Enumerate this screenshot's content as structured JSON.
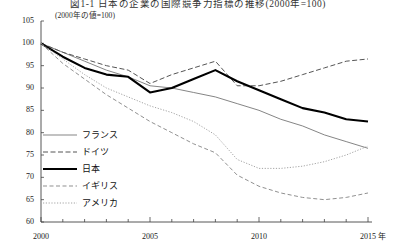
{
  "title": "図1-1  日本の企業の国際競争力指標の推移(2000年=100)",
  "subtitle": "(2000年の値=100)",
  "axis": {
    "x_unit": "年",
    "x_ticks": [
      "2000",
      "2005",
      "2010",
      "2015"
    ],
    "y_ticks": [
      "105",
      "100",
      "95",
      "90",
      "85",
      "80",
      "75",
      "70",
      "65",
      "60"
    ]
  },
  "legend": [
    {
      "label": "フランス",
      "style": "solid-thin",
      "color": "#6f6f6f"
    },
    {
      "label": "ドイツ",
      "style": "dashed",
      "color": "#555555"
    },
    {
      "label": "日本",
      "style": "solid-bold",
      "color": "#000000"
    },
    {
      "label": "イギリス",
      "style": "long-dash",
      "color": "#8a8a8a"
    },
    {
      "label": "アメリカ",
      "style": "dotted",
      "color": "#9a9a9a"
    }
  ],
  "chart_data": {
    "type": "line",
    "title": "図1-1  日本の企業の国際競争力指標の推移(2000年=100)",
    "subtitle": "(2000年の値=100)",
    "xlabel": "年",
    "ylabel": "",
    "xlim": [
      2000,
      2015
    ],
    "ylim": [
      60,
      105
    ],
    "ytick_values": [
      105,
      100,
      95,
      90,
      85,
      80,
      75,
      70,
      65,
      60
    ],
    "xtick_values": [
      2000,
      2005,
      2010,
      2015
    ],
    "grid": false,
    "legend_position": "inside-lower-left",
    "x": [
      2000,
      2001,
      2002,
      2003,
      2004,
      2005,
      2006,
      2007,
      2008,
      2009,
      2010,
      2011,
      2012,
      2013,
      2014,
      2015
    ],
    "series": [
      {
        "name": "フランス",
        "style": "solid-thin",
        "color": "#6f6f6f",
        "values": [
          100,
          98.0,
          96.0,
          94.0,
          92.5,
          90.5,
          90.0,
          89.0,
          88.0,
          86.5,
          85.0,
          83.0,
          81.5,
          79.5,
          78.0,
          76.5
        ]
      },
      {
        "name": "ドイツ",
        "style": "dashed",
        "color": "#555555",
        "values": [
          100,
          98.0,
          96.5,
          95.0,
          94.0,
          91.0,
          93.0,
          94.5,
          96.0,
          90.5,
          90.5,
          91.5,
          93.0,
          94.5,
          96.0,
          96.5
        ]
      },
      {
        "name": "日本",
        "style": "solid-bold",
        "color": "#000000",
        "values": [
          100,
          97.0,
          94.5,
          93.0,
          92.5,
          89.0,
          90.0,
          92.0,
          94.0,
          91.5,
          89.5,
          87.5,
          85.5,
          84.5,
          83.0,
          82.5
        ]
      },
      {
        "name": "イギリス",
        "style": "long-dash",
        "color": "#8a8a8a",
        "values": [
          100,
          95.5,
          92.0,
          88.5,
          85.5,
          82.5,
          80.0,
          77.5,
          75.5,
          70.5,
          68.0,
          66.5,
          65.5,
          65.0,
          65.5,
          66.5
        ]
      },
      {
        "name": "アメリカ",
        "style": "dotted",
        "color": "#9a9a9a",
        "values": [
          100,
          96.5,
          93.0,
          90.0,
          88.0,
          86.0,
          84.5,
          82.5,
          79.5,
          74.0,
          72.0,
          72.0,
          72.5,
          73.5,
          75.0,
          77.0
        ]
      }
    ]
  }
}
